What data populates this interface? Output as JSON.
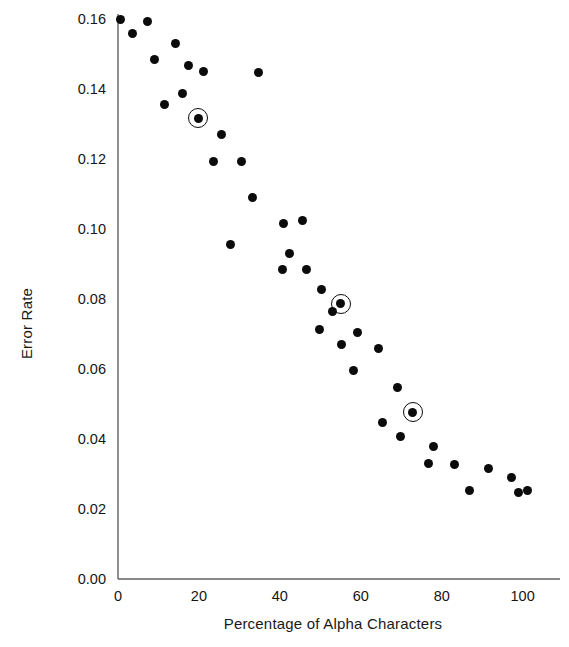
{
  "chart_data": {
    "type": "scatter",
    "title": "",
    "xlabel": "Percentage of Alpha Characters",
    "ylabel": "Error Rate",
    "xlim": [
      0,
      108
    ],
    "ylim": [
      0.0,
      0.16
    ],
    "xticks": [
      0,
      20,
      40,
      60,
      80,
      100
    ],
    "xtick_labels": [
      "0",
      "20",
      "40",
      "60",
      "80",
      "100"
    ],
    "yticks": [
      0.0,
      0.02,
      0.04,
      0.06,
      0.08,
      0.1,
      0.12,
      0.14,
      0.16
    ],
    "ytick_labels": [
      "0.00",
      "0.02",
      "0.04",
      "0.06",
      "0.08",
      "0.10",
      "0.12",
      "0.14",
      "0.16"
    ],
    "grid": false,
    "legend": null,
    "marker_color": "#0b0b0b",
    "axis_color": "#555555",
    "series": [
      {
        "name": "Error rate vs percentage of alpha characters",
        "marker": "filled-circle",
        "points": [
          {
            "x": 0.5,
            "y": 0.16
          },
          {
            "x": 7.4,
            "y": 0.1594
          },
          {
            "x": 3.7,
            "y": 0.156
          },
          {
            "x": 14.3,
            "y": 0.1531
          },
          {
            "x": 9.1,
            "y": 0.1483
          },
          {
            "x": 17.5,
            "y": 0.1466
          },
          {
            "x": 21.2,
            "y": 0.1449
          },
          {
            "x": 34.8,
            "y": 0.1446
          },
          {
            "x": 16.0,
            "y": 0.1386
          },
          {
            "x": 11.4,
            "y": 0.1357
          },
          {
            "x": 25.7,
            "y": 0.1271
          },
          {
            "x": 23.5,
            "y": 0.1194
          },
          {
            "x": 30.4,
            "y": 0.1194
          },
          {
            "x": 33.3,
            "y": 0.1089
          },
          {
            "x": 45.7,
            "y": 0.1023
          },
          {
            "x": 41.0,
            "y": 0.1017
          },
          {
            "x": 27.7,
            "y": 0.0957
          },
          {
            "x": 42.5,
            "y": 0.0931
          },
          {
            "x": 40.7,
            "y": 0.0883
          },
          {
            "x": 46.7,
            "y": 0.0883
          },
          {
            "x": 50.4,
            "y": 0.0826
          },
          {
            "x": 53.1,
            "y": 0.0763
          },
          {
            "x": 49.9,
            "y": 0.0714
          },
          {
            "x": 59.3,
            "y": 0.0703
          },
          {
            "x": 55.3,
            "y": 0.0669
          },
          {
            "x": 64.4,
            "y": 0.066
          },
          {
            "x": 58.3,
            "y": 0.0597
          },
          {
            "x": 69.1,
            "y": 0.0546
          },
          {
            "x": 65.4,
            "y": 0.0446
          },
          {
            "x": 69.9,
            "y": 0.0406
          },
          {
            "x": 78.0,
            "y": 0.038
          },
          {
            "x": 76.8,
            "y": 0.0329
          },
          {
            "x": 83.2,
            "y": 0.0326
          },
          {
            "x": 91.6,
            "y": 0.0317
          },
          {
            "x": 86.9,
            "y": 0.0254
          },
          {
            "x": 99.1,
            "y": 0.0246
          },
          {
            "x": 101.2,
            "y": 0.0254
          },
          {
            "x": 97.3,
            "y": 0.0291
          }
        ]
      }
    ],
    "highlighted_points": [
      {
        "x": 19.8,
        "y": 0.1317,
        "marker": "circled-dot"
      },
      {
        "x": 55.1,
        "y": 0.0786,
        "marker": "circled-dot"
      },
      {
        "x": 72.8,
        "y": 0.0477,
        "marker": "circled-dot"
      }
    ]
  }
}
